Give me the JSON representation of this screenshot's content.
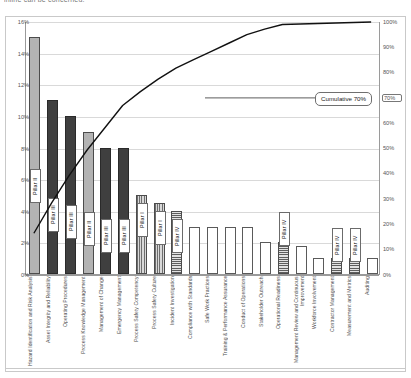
{
  "meta": {
    "clipped_title": "inline can be concerned."
  },
  "axes": {
    "left_ticks": [
      "16%",
      "14%",
      "12%",
      "10%",
      "8%",
      "6%",
      "4%",
      "2%",
      "0%"
    ],
    "right_ticks": [
      "100%",
      "90%",
      "80%",
      "70%",
      "60%",
      "50%",
      "40%",
      "30%",
      "20%",
      "10%",
      "0%"
    ],
    "highlighted_right_tick": "70%"
  },
  "annotations": {
    "cumulative_callout": "Cumulative 70%"
  },
  "chart_data": {
    "type": "bar",
    "title": "",
    "xlabel": "",
    "ylabel": "",
    "ylim": [
      0,
      16
    ],
    "y2lim": [
      0,
      100
    ],
    "grid": true,
    "legend_position": "none",
    "categories": [
      "Hazard Identification and Risk Analysis",
      "Asset Integrity and Reliability",
      "Operating Procedures",
      "Process Knowledge Management",
      "Management of Change",
      "Emergency Management",
      "Process Safety Competency",
      "Process Safety Culture",
      "Incident Investigation",
      "Compliance with Standards",
      "Safe Work Practices",
      "Training & Performance Assurance",
      "Conduct of Operations",
      "Stakeholder Outreach",
      "Operational Readiness",
      "Management Review and Continuous Improvement",
      "Workforce Involvement",
      "Contractor Management",
      "Measurement and Metrics",
      "Auditing"
    ],
    "values": [
      15.0,
      11.0,
      10.0,
      9.0,
      8.0,
      8.0,
      5.0,
      4.5,
      4.0,
      3.0,
      3.0,
      3.0,
      3.0,
      2.0,
      2.0,
      1.8,
      1.0,
      1.0,
      1.0,
      1.0
    ],
    "cumulative_percent": [
      16.5,
      28.5,
      39.5,
      49.4,
      58.2,
      67.0,
      72.5,
      77.4,
      81.8,
      85.1,
      88.4,
      91.7,
      95.0,
      97.2,
      99.0,
      99.2,
      99.4,
      99.6,
      99.8,
      100.0
    ],
    "bar_pillars": [
      "Pillar II",
      "Pillar III",
      "Pillar III",
      "Pillar II",
      "Pillar III",
      "Pillar III",
      "Pillar I",
      "Pillar I",
      "Pillar IV",
      "",
      "",
      "",
      "",
      "",
      "Pillar IV",
      "",
      "",
      "Pillar IV",
      "Pillar IV",
      ""
    ],
    "bar_styles": [
      "p2",
      "p3",
      "p3",
      "p2",
      "p3",
      "p3",
      "p1",
      "p1",
      "p4",
      "plain",
      "plain",
      "plain",
      "plain",
      "plain",
      "p4",
      "plain",
      "plain",
      "p4",
      "p4",
      "plain"
    ],
    "series": [
      {
        "name": "Share of findings",
        "values": [
          15.0,
          11.0,
          10.0,
          9.0,
          8.0,
          8.0,
          5.0,
          4.5,
          4.0,
          3.0,
          3.0,
          3.0,
          3.0,
          2.0,
          2.0,
          1.8,
          1.0,
          1.0,
          1.0,
          1.0
        ]
      },
      {
        "name": "Cumulative %",
        "values": [
          16.5,
          28.5,
          39.5,
          49.4,
          58.2,
          67.0,
          72.5,
          77.4,
          81.8,
          85.1,
          88.4,
          91.7,
          95.0,
          97.2,
          99.0,
          99.2,
          99.4,
          99.6,
          99.8,
          100.0
        ]
      }
    ],
    "colors": {
      "pillar_i": "#6e6e6e",
      "pillar_ii": "#b3b3b3",
      "pillar_iii": "#3f3f3f",
      "pillar_iv": "#5e5e5e",
      "plain": "#ffffff",
      "line": "#111111",
      "grid": "#d9d9d9"
    }
  }
}
